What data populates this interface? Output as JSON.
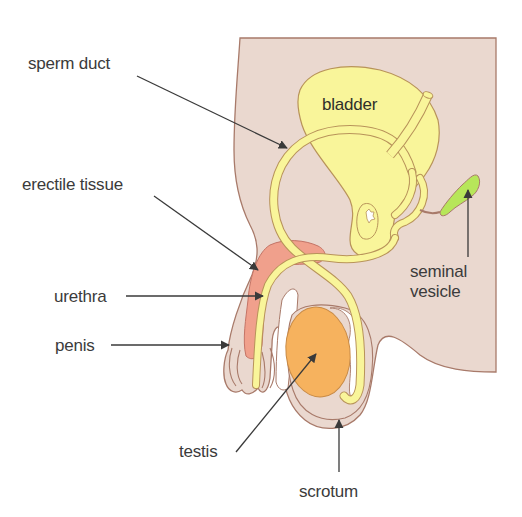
{
  "diagram": {
    "labels": {
      "sperm_duct": "sperm duct",
      "erectile_tissue": "erectile tissue",
      "urethra": "urethra",
      "penis": "penis",
      "testis": "testis",
      "scrotum": "scrotum",
      "bladder": "bladder",
      "seminal_vesicle_line1": "seminal",
      "seminal_vesicle_line2": "vesicle"
    },
    "colors": {
      "body": "#ead8cf",
      "body_outline": "#a87a6a",
      "tube_yellow": "#f9f59a",
      "tube_outline": "#b8935a",
      "erectile": "#f0a08c",
      "testis": "#f6b25e",
      "seminal_vesicle": "#b7e65a",
      "label_text": "#3b3b3b",
      "leader_line": "#3a3a3a"
    }
  }
}
